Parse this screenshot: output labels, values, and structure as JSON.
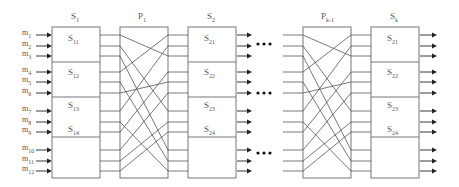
{
  "inputs": [
    {
      "base": "m",
      "sub": "1",
      "y": 35
    },
    {
      "base": "m",
      "sub": "2",
      "y": 46
    },
    {
      "base": "m",
      "sub": "3",
      "y": 56
    },
    {
      "base": "m",
      "sub": "4",
      "y": 72
    },
    {
      "base": "m",
      "sub": "5",
      "y": 82
    },
    {
      "base": "m",
      "sub": "6",
      "y": 93
    },
    {
      "base": "m",
      "sub": "7",
      "y": 111
    },
    {
      "base": "m",
      "sub": "8",
      "y": 122
    },
    {
      "base": "m",
      "sub": "9",
      "y": 132
    },
    {
      "base": "m",
      "sub": "10",
      "y": 150
    },
    {
      "base": "m",
      "sub": "11",
      "y": 161
    },
    {
      "base": "m",
      "sub": "12",
      "y": 171
    }
  ],
  "stages": [
    {
      "id": "s1",
      "title_base": "S",
      "title_sub": "1",
      "x": 52,
      "sub_labels": [
        {
          "base": "S",
          "sub": "11",
          "y": 34
        },
        {
          "base": "S",
          "sub": "12",
          "y": 68
        },
        {
          "base": "S",
          "sub": "13",
          "y": 101
        },
        {
          "base": "S",
          "sub": "14",
          "y": 125
        }
      ]
    },
    {
      "id": "s2",
      "title_base": "S",
      "title_sub": "2",
      "x": 188,
      "sub_labels": [
        {
          "base": "S",
          "sub": "21",
          "y": 34
        },
        {
          "base": "S",
          "sub": "22",
          "y": 68
        },
        {
          "base": "S",
          "sub": "23",
          "y": 101
        },
        {
          "base": "S",
          "sub": "24",
          "y": 125
        }
      ]
    },
    {
      "id": "sk",
      "title_base": "S",
      "title_sub": "k",
      "x": 371,
      "sub_labels": [
        {
          "base": "S",
          "sub": "21",
          "y": 34
        },
        {
          "base": "S",
          "sub": "22",
          "y": 68
        },
        {
          "base": "S",
          "sub": "23",
          "y": 101
        },
        {
          "base": "S",
          "sub": "24",
          "y": 125
        }
      ]
    }
  ],
  "permutations": [
    {
      "id": "p1",
      "title_base": "P",
      "title_sub": "1",
      "x": 120
    },
    {
      "id": "pk1",
      "title_base": "P",
      "title_sub": "k-1",
      "x": 303
    }
  ],
  "permutation_map": [
    [
      0,
      2
    ],
    [
      1,
      6
    ],
    [
      2,
      9
    ],
    [
      3,
      0
    ],
    [
      4,
      10
    ],
    [
      5,
      4
    ],
    [
      6,
      1
    ],
    [
      7,
      11
    ],
    [
      8,
      3
    ],
    [
      9,
      5
    ],
    [
      10,
      7
    ],
    [
      11,
      8
    ]
  ],
  "line_ys": [
    35,
    46,
    56,
    72,
    82,
    93,
    111,
    122,
    132,
    150,
    161,
    171
  ],
  "ellipsis_rows": [
    44,
    93,
    153
  ],
  "colors": {
    "line": "#555555",
    "box": "#777777",
    "arrow": "#222222",
    "dots": "#111111"
  }
}
